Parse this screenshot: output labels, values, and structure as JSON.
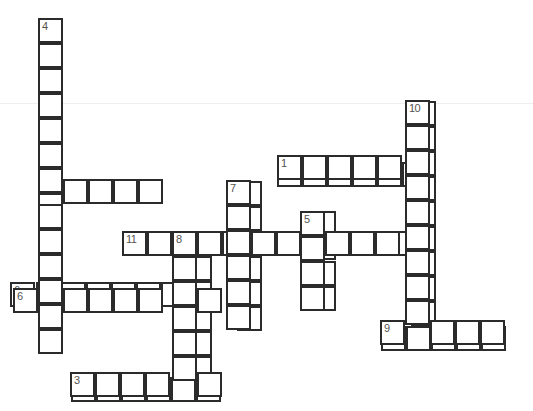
{
  "puzzle": {
    "title": "Crossword Grid",
    "cell_size": 25,
    "origin_x": 38,
    "origin_y": 18,
    "grid_cols": 20,
    "grid_rows": 16,
    "cell_fill": "#ffffff",
    "cell_border": "#2b2b2b",
    "number_color": "#55544f",
    "background": "#ffffff",
    "scanline_y": 103,
    "scanline_color": "#f0eeea",
    "entries": [
      {
        "number": "1",
        "direction": "across",
        "col": 9.55,
        "row": 5.75,
        "length": 6
      },
      {
        "number": "2",
        "direction": "across",
        "col": 0,
        "row": 6.45,
        "length": 5
      },
      {
        "number": "3",
        "direction": "across",
        "col": 1.3,
        "row": 14.35,
        "length": 6
      },
      {
        "number": "4",
        "direction": "down",
        "col": 0,
        "row": 0,
        "length": 11
      },
      {
        "number": "5",
        "direction": "down",
        "col": 10.9,
        "row": 7.7,
        "length": 4
      },
      {
        "number": "6",
        "direction": "across",
        "col": -1.1,
        "row": 10.55,
        "length": 7
      },
      {
        "number": "7",
        "direction": "down",
        "col": 7.95,
        "row": 6.5,
        "length": 6
      },
      {
        "number": "8",
        "direction": "down",
        "col": 5.95,
        "row": 8.5,
        "length": 6
      },
      {
        "number": "9",
        "direction": "across",
        "col": 13.7,
        "row": 12.3,
        "length": 5
      },
      {
        "number": "10",
        "direction": "down",
        "col": 14.9,
        "row": 3.3,
        "length": 9
      },
      {
        "number": "11",
        "direction": "across",
        "col": 3.35,
        "row": 8.5,
        "length": 12
      }
    ],
    "cells": [
      {
        "x": 38,
        "y": 18,
        "number": "4"
      },
      {
        "x": 38,
        "y": 43,
        "number": ""
      },
      {
        "x": 38,
        "y": 68,
        "number": ""
      },
      {
        "x": 38,
        "y": 93,
        "number": ""
      },
      {
        "x": 38,
        "y": 118,
        "number": ""
      },
      {
        "x": 38,
        "y": 143,
        "number": ""
      },
      {
        "x": 38,
        "y": 179,
        "number": "2"
      },
      {
        "x": 63,
        "y": 179,
        "number": ""
      },
      {
        "x": 88,
        "y": 179,
        "number": ""
      },
      {
        "x": 113,
        "y": 179,
        "number": ""
      },
      {
        "x": 138,
        "y": 179,
        "number": ""
      },
      {
        "x": 38,
        "y": 204,
        "number": ""
      },
      {
        "x": 38,
        "y": 229,
        "number": ""
      },
      {
        "x": 38,
        "y": 254,
        "number": ""
      },
      {
        "x": 38,
        "y": 279,
        "number": ""
      },
      {
        "x": 38,
        "y": 304,
        "number": ""
      },
      {
        "x": 38,
        "y": 329,
        "number": ""
      },
      {
        "x": 405,
        "y": 100,
        "number": "10"
      },
      {
        "x": 405,
        "y": 125,
        "number": ""
      },
      {
        "x": 405,
        "y": 150,
        "number": ""
      },
      {
        "x": 405,
        "y": 175,
        "number": ""
      },
      {
        "x": 405,
        "y": 200,
        "number": ""
      },
      {
        "x": 405,
        "y": 225,
        "number": ""
      },
      {
        "x": 405,
        "y": 250,
        "number": ""
      },
      {
        "x": 405,
        "y": 275,
        "number": ""
      },
      {
        "x": 405,
        "y": 300,
        "number": ""
      },
      {
        "x": 277,
        "y": 155,
        "number": "1"
      },
      {
        "x": 302,
        "y": 155,
        "number": ""
      },
      {
        "x": 327,
        "y": 155,
        "number": ""
      },
      {
        "x": 352,
        "y": 155,
        "number": ""
      },
      {
        "x": 377,
        "y": 155,
        "number": ""
      },
      {
        "x": 226,
        "y": 180,
        "number": "7"
      },
      {
        "x": 226,
        "y": 205,
        "number": ""
      },
      {
        "x": 226,
        "y": 230,
        "number": ""
      },
      {
        "x": 226,
        "y": 255,
        "number": ""
      },
      {
        "x": 226,
        "y": 280,
        "number": ""
      },
      {
        "x": 226,
        "y": 305,
        "number": ""
      },
      {
        "x": 300,
        "y": 211,
        "number": "5"
      },
      {
        "x": 300,
        "y": 236,
        "number": ""
      },
      {
        "x": 300,
        "y": 261,
        "number": ""
      },
      {
        "x": 300,
        "y": 286,
        "number": ""
      },
      {
        "x": 122,
        "y": 231,
        "number": "11"
      },
      {
        "x": 147,
        "y": 231,
        "number": ""
      },
      {
        "x": 172,
        "y": 231,
        "number": "8"
      },
      {
        "x": 197,
        "y": 231,
        "number": ""
      },
      {
        "x": 251,
        "y": 231,
        "number": ""
      },
      {
        "x": 276,
        "y": 231,
        "number": ""
      },
      {
        "x": 325,
        "y": 231,
        "number": ""
      },
      {
        "x": 350,
        "y": 231,
        "number": ""
      },
      {
        "x": 375,
        "y": 231,
        "number": ""
      },
      {
        "x": 172,
        "y": 256,
        "number": ""
      },
      {
        "x": 172,
        "y": 281,
        "number": ""
      },
      {
        "x": 172,
        "y": 306,
        "number": ""
      },
      {
        "x": 172,
        "y": 331,
        "number": ""
      },
      {
        "x": 172,
        "y": 356,
        "number": ""
      },
      {
        "x": 13,
        "y": 288,
        "number": "6"
      },
      {
        "x": 63,
        "y": 288,
        "number": ""
      },
      {
        "x": 88,
        "y": 288,
        "number": ""
      },
      {
        "x": 113,
        "y": 288,
        "number": ""
      },
      {
        "x": 138,
        "y": 288,
        "number": ""
      },
      {
        "x": 197,
        "y": 288,
        "number": ""
      },
      {
        "x": 380,
        "y": 320,
        "number": "9"
      },
      {
        "x": 430,
        "y": 320,
        "number": ""
      },
      {
        "x": 455,
        "y": 320,
        "number": ""
      },
      {
        "x": 480,
        "y": 320,
        "number": ""
      },
      {
        "x": 70,
        "y": 372,
        "number": "3"
      },
      {
        "x": 95,
        "y": 372,
        "number": ""
      },
      {
        "x": 120,
        "y": 372,
        "number": ""
      },
      {
        "x": 145,
        "y": 372,
        "number": ""
      },
      {
        "x": 197,
        "y": 372,
        "number": ""
      }
    ]
  }
}
